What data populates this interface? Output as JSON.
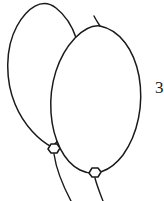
{
  "image": {
    "title": "Two outlined balloons line drawing",
    "background_color": "#ffffff",
    "stroke_color": "#1a1a1a",
    "stroke_width": 1.5,
    "width": 164,
    "height": 201
  },
  "edge_text": {
    "value": "3",
    "note": "partially cropped character at right edge"
  },
  "objects": [
    {
      "name": "balloon-back",
      "label": "Balloon (back, upper-left)",
      "fill": "none",
      "outline": "#1a1a1a",
      "body_path": "M 56 8 C 74 22, 84 50, 80 82 C 76 114, 62 138, 52 147 C 40 141, 24 126, 15 104 C 5 80, 5 48, 17 26 C 27 8, 42 -3, 56 8 Z",
      "knot": {
        "cx": 54,
        "cy": 149,
        "rx": 6,
        "ry": 5
      },
      "string_path": "M 54 154 C 56 168, 62 184, 71 201"
    },
    {
      "name": "balloon-front",
      "label": "Balloon (front, lower-right)",
      "fill": "none",
      "outline": "#1a1a1a",
      "body_path": "M 100 26 C 120 30, 134 50, 139 76 C 144 104, 138 134, 123 155 C 110 172, 94 177, 80 170 C 64 162, 53 140, 51 113 C 49 84, 58 56, 75 38 C 83 30, 92 25, 100 26 Z",
      "knot": {
        "cx": 95,
        "cy": 173,
        "rx": 6,
        "ry": 5
      },
      "string_path": "M 95 178 C 97 186, 100 193, 103 201"
    }
  ],
  "highlight_stub": {
    "name": "balloon-front-top-tick",
    "path": "M 94 16 C 96 20, 98 23, 100 26"
  }
}
